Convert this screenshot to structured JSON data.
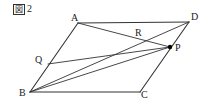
{
  "caption": {
    "marker_glyph": "図",
    "number": "2",
    "full_text": "図 2"
  },
  "diagram": {
    "type": "geometry-figure",
    "shape": "parallelogram",
    "stroke_color": "#333333",
    "background_color": "#ffffff",
    "point_marker_color": "#000000",
    "vertices": {
      "A": {
        "label": "A",
        "x": 78,
        "y": 23,
        "label_x": 71,
        "label_y": 13
      },
      "B": {
        "label": "B",
        "x": 30,
        "y": 92,
        "label_x": 19,
        "label_y": 88
      },
      "C": {
        "label": "C",
        "x": 140,
        "y": 92,
        "label_x": 141,
        "label_y": 90
      },
      "D": {
        "label": "D",
        "x": 189,
        "y": 22,
        "label_x": 191,
        "label_y": 12
      },
      "P": {
        "label": "P",
        "x": 170,
        "y": 47,
        "label_x": 175,
        "label_y": 43
      },
      "Q": {
        "label": "Q",
        "x": 48,
        "y": 64,
        "label_x": 35,
        "label_y": 55
      },
      "R": {
        "label": "R",
        "x": 140,
        "y": 40,
        "label_x": 135,
        "label_y": 28
      }
    },
    "sides": [
      {
        "name": "side-AD",
        "from": "A",
        "to": "D"
      },
      {
        "name": "side-AB",
        "from": "A",
        "to": "B"
      },
      {
        "name": "side-BC",
        "from": "B",
        "to": "C"
      },
      {
        "name": "side-CD",
        "from": "C",
        "to": "D"
      }
    ],
    "segments": [
      {
        "name": "segment-AP",
        "from": "A",
        "to": "P"
      },
      {
        "name": "segment-BD",
        "from": "B",
        "to": "D"
      },
      {
        "name": "segment-BP",
        "from": "B",
        "to": "P"
      },
      {
        "name": "segment-QP",
        "from": "Q",
        "to": "P"
      }
    ],
    "marked_points": [
      {
        "name": "point-P",
        "at": "P"
      }
    ],
    "intersections": [
      {
        "name": "point-R",
        "at": "R",
        "of": [
          "segment-AP",
          "segment-BD"
        ]
      },
      {
        "name": "point-Q",
        "at": "Q",
        "of": [
          "side-AB",
          "segment-QP"
        ]
      }
    ]
  }
}
